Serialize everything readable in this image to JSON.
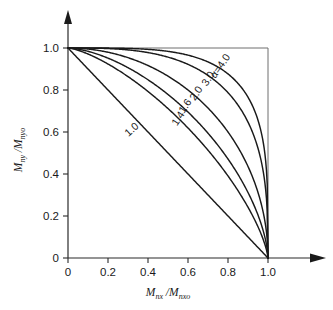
{
  "chart_data": {
    "type": "line",
    "title": "",
    "xlabel": "M_nx / M_nxo",
    "ylabel": "M_ny / M_nyo",
    "xlabel_parts": {
      "m1": "M",
      "sub1": "nx",
      "slash": " /",
      "m2": "M",
      "sub2": "nxo"
    },
    "ylabel_parts": {
      "m1": "M",
      "sub1": "ny",
      "slash": " /",
      "m2": "M",
      "sub2": "nyo"
    },
    "xlim": [
      0,
      1.0
    ],
    "ylim": [
      0,
      1.0
    ],
    "grid": false,
    "legend": "inline-curve-labels",
    "xticks": [
      0,
      0.2,
      0.4,
      0.6,
      0.8,
      1.0
    ],
    "xticklabels": [
      "0",
      "0.2",
      "0.4",
      "0.6",
      "0.8",
      "1.0"
    ],
    "yticks": [
      0,
      0.2,
      0.4,
      0.6,
      0.8,
      1.0
    ],
    "yticklabels": [
      "0",
      "0.2",
      "0.4",
      "0.6",
      "0.8",
      "1.0"
    ],
    "equation": "(Mnx/Mnxo)^alpha + (Mny/Mnyo)^alpha = 1",
    "series": [
      {
        "name": "alpha-1.0",
        "alpha": 1.0,
        "label": "1.0",
        "label_x": 0.33,
        "label_y": 0.6,
        "label_rotation": -42,
        "x": [
          0.0,
          0.1,
          0.2,
          0.3,
          0.4,
          0.5,
          0.6,
          0.7,
          0.8,
          0.9,
          1.0
        ],
        "y": [
          1.0,
          0.9,
          0.8,
          0.7,
          0.6,
          0.5,
          0.4,
          0.3,
          0.2,
          0.1,
          0.0
        ]
      },
      {
        "name": "alpha-1.4",
        "alpha": 1.4,
        "label": "1.4",
        "label_x": 0.565,
        "label_y": 0.655,
        "label_rotation": -57,
        "x": [
          0.0,
          0.1,
          0.2,
          0.3,
          0.4,
          0.5,
          0.6,
          0.7,
          0.8,
          0.9,
          0.95,
          1.0
        ],
        "y": [
          1.0,
          0.972,
          0.937,
          0.896,
          0.848,
          0.792,
          0.726,
          0.647,
          0.549,
          0.414,
          0.319,
          0.0
        ]
      },
      {
        "name": "alpha-1.6",
        "alpha": 1.6,
        "label": "1.6",
        "label_x": 0.6,
        "label_y": 0.715,
        "label_rotation": -57,
        "x": [
          0.0,
          0.1,
          0.2,
          0.3,
          0.4,
          0.5,
          0.6,
          0.7,
          0.8,
          0.9,
          0.95,
          1.0
        ],
        "y": [
          1.0,
          0.984,
          0.961,
          0.93,
          0.891,
          0.843,
          0.784,
          0.711,
          0.617,
          0.483,
          0.383,
          0.0
        ]
      },
      {
        "name": "alpha-2.0",
        "alpha": 2.0,
        "label": "2.0",
        "label_x": 0.655,
        "label_y": 0.775,
        "label_rotation": -57,
        "x": [
          0.0,
          0.1,
          0.2,
          0.3,
          0.4,
          0.5,
          0.6,
          0.7,
          0.8,
          0.9,
          0.95,
          1.0
        ],
        "y": [
          1.0,
          0.995,
          0.98,
          0.954,
          0.917,
          0.866,
          0.8,
          0.714,
          0.6,
          0.436,
          0.312,
          0.0
        ]
      },
      {
        "name": "alpha-3.0",
        "alpha": 3.0,
        "label": "3.0",
        "label_x": 0.715,
        "label_y": 0.845,
        "label_rotation": -57,
        "x": [
          0.0,
          0.1,
          0.2,
          0.3,
          0.4,
          0.5,
          0.6,
          0.7,
          0.8,
          0.9,
          0.95,
          1.0
        ],
        "y": [
          1.0,
          0.9997,
          0.997,
          0.991,
          0.978,
          0.956,
          0.919,
          0.862,
          0.771,
          0.615,
          0.479,
          0.0
        ]
      },
      {
        "name": "alpha-4.0",
        "alpha": 4.0,
        "label": "α=4.0",
        "label_x": 0.775,
        "label_y": 0.905,
        "label_rotation": -55,
        "x": [
          0.0,
          0.1,
          0.2,
          0.3,
          0.4,
          0.5,
          0.6,
          0.7,
          0.8,
          0.9,
          0.95,
          1.0
        ],
        "y": [
          1.0,
          1.0,
          0.9996,
          0.998,
          0.993,
          0.984,
          0.966,
          0.934,
          0.875,
          0.757,
          0.64,
          0.0
        ]
      }
    ]
  },
  "colors": {
    "background": "#ffffff",
    "curve": "#1a1a1a",
    "axis": "#2b2b2b",
    "box": "#6e6e6e",
    "text": "#1a1a1a"
  }
}
